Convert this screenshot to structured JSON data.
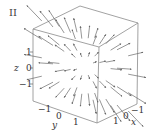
{
  "panel_label": "II",
  "colors": {
    "edge": "#8a8a8a",
    "arrow": "#6a6a6a",
    "text": "#333333",
    "background": "#ffffff"
  },
  "axes": {
    "z": {
      "label": "z",
      "ticks": [
        "1",
        "0",
        "−1"
      ]
    },
    "y": {
      "label": "y",
      "ticks": [
        "−1",
        "0",
        "1"
      ]
    },
    "x": {
      "label": "x",
      "ticks": [
        "1",
        "0",
        "−1"
      ]
    }
  },
  "figure": {
    "type": "3d-vector-field",
    "box": {
      "top_back": [
        80,
        6
      ],
      "top_left": [
        33,
        29
      ],
      "top_right": [
        138,
        23
      ],
      "top_front": [
        99,
        47
      ],
      "bottom_left": [
        33,
        101
      ],
      "bottom_right": [
        137,
        104
      ],
      "bottom_front": [
        97,
        123
      ]
    },
    "center": [
      85,
      66
    ]
  }
}
